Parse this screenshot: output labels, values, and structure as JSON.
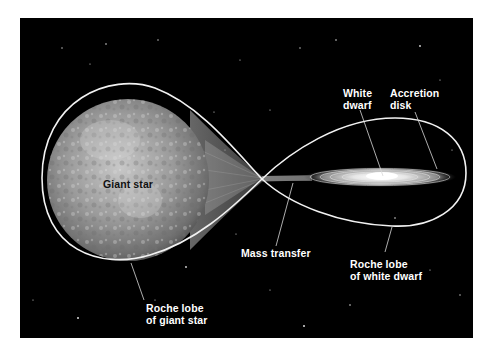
{
  "diagram": {
    "type": "binary-star-mass-transfer",
    "background": "#000000",
    "lobe_color": "#f2f2f2",
    "labels": {
      "giant_star": "Giant star",
      "white_dwarf": [
        "White",
        "dwarf"
      ],
      "accretion_disk": [
        "Accretion",
        "disk"
      ],
      "mass_transfer": "Mass transfer",
      "roche_lobe_white_dwarf": [
        "Roche lobe",
        "of white dwarf"
      ],
      "roche_lobe_giant_star": [
        "Roche lobe",
        "of giant star"
      ]
    }
  }
}
